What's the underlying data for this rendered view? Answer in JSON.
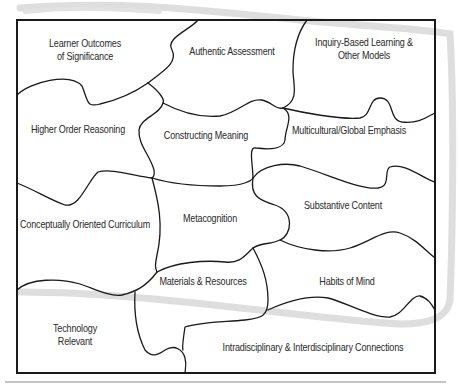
{
  "diagram": {
    "type": "puzzle-concept-map",
    "colors": {
      "line": "#1a1a1a",
      "text": "#2a2a2a",
      "swoosh": "#d6d6d6",
      "rule": "#8a8a8a",
      "background": "#ffffff"
    },
    "pieces": [
      {
        "id": "learner-outcomes",
        "line1": "Learner Outcomes",
        "line2": "of Significance"
      },
      {
        "id": "authentic-assessment",
        "line1": "Authentic Assessment",
        "line2": ""
      },
      {
        "id": "inquiry-based",
        "line1": "Inquiry-Based Learning &",
        "line2": "Other Models"
      },
      {
        "id": "higher-order",
        "line1": "Higher Order Reasoning",
        "line2": ""
      },
      {
        "id": "constructing-meaning",
        "line1": "Constructing Meaning",
        "line2": ""
      },
      {
        "id": "multicultural",
        "line1": "Multicultural/Global Emphasis",
        "line2": ""
      },
      {
        "id": "conceptually-oriented",
        "line1": "Conceptually Oriented Curriculum",
        "line2": ""
      },
      {
        "id": "metacognition",
        "line1": "Metacognition",
        "line2": ""
      },
      {
        "id": "substantive-content",
        "line1": "Substantive Content",
        "line2": ""
      },
      {
        "id": "materials-resources",
        "line1": "Materials & Resources",
        "line2": ""
      },
      {
        "id": "habits-of-mind",
        "line1": "Habits of Mind",
        "line2": ""
      },
      {
        "id": "technology-relevant",
        "line1": "Technology",
        "line2": "Relevant"
      },
      {
        "id": "intra-interdisciplinary",
        "line1": "Intradisciplinary & Interdisciplinary Connections",
        "line2": ""
      }
    ]
  }
}
